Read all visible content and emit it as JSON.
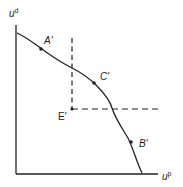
{
  "diagram": {
    "type": "utility-possibility-frontier",
    "axes": {
      "y_label": "u",
      "y_label_sup": "d",
      "x_label": "u",
      "x_label_sup": "p"
    },
    "points": [
      {
        "id": "A",
        "label": "A′"
      },
      {
        "id": "C",
        "label": "C′"
      },
      {
        "id": "B",
        "label": "B′"
      },
      {
        "id": "E",
        "label": "E′"
      }
    ],
    "colors": {
      "line": "#222222",
      "background": "#ffffff"
    }
  }
}
